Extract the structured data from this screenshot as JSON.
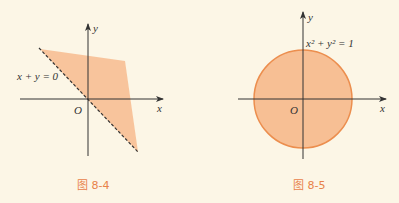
{
  "figures": [
    {
      "id": "fig-8-4",
      "caption": "图 8-4",
      "equation_label": "x + y = 0",
      "origin_label": "O",
      "x_axis_label": "x",
      "y_axis_label": "y",
      "description": "Shaded half-plane region bounded by dashed line x + y = 0 (region above/right of line)"
    },
    {
      "id": "fig-8-5",
      "caption": "图 8-5",
      "equation_label": "x² + y² = 1",
      "origin_label": "O",
      "x_axis_label": "x",
      "y_axis_label": "y",
      "description": "Shaded unit disk bounded by circle x² + y² = 1"
    }
  ],
  "colors": {
    "background": "#fcf6e6",
    "fill": "#f7bf94",
    "circle_stroke": "#ec8e4e",
    "axis": "#333333",
    "caption": "#e8824a"
  }
}
